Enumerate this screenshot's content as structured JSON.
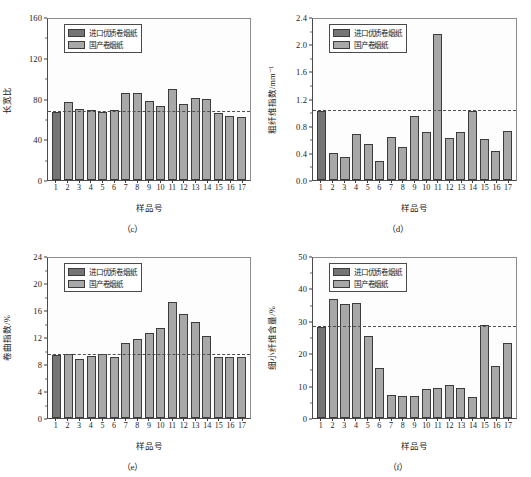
{
  "figure": {
    "panel_count": 4,
    "legend": {
      "imported_label": "进口优质卷烟纸",
      "domestic_label": "国产卷烟纸",
      "imported_color": "#757575",
      "domestic_color": "#a8a8a8"
    },
    "shared_xlabel": "样品号",
    "categories": [
      "1",
      "2",
      "3",
      "4",
      "5",
      "6",
      "7",
      "8",
      "9",
      "10",
      "11",
      "12",
      "13",
      "14",
      "15",
      "16",
      "17"
    ]
  },
  "chart_data": [
    {
      "type": "bar",
      "panel": "c",
      "caption": "（c）",
      "title": "",
      "xlabel": "样品号",
      "ylabel": "长宽比",
      "categories": [
        "1",
        "2",
        "3",
        "4",
        "5",
        "6",
        "7",
        "8",
        "9",
        "10",
        "11",
        "12",
        "13",
        "14",
        "15",
        "16",
        "17"
      ],
      "values": [
        68,
        78,
        71,
        70,
        68,
        70,
        86,
        86,
        79,
        74,
        90,
        76,
        82,
        81,
        67,
        64,
        63
      ],
      "first_is_imported": true,
      "ylim": [
        0,
        160
      ],
      "yticks": [
        0,
        40,
        80,
        120,
        160
      ],
      "ytick_labels": [
        "0",
        "40",
        "80",
        "120",
        "160"
      ],
      "minor_ticks": true,
      "reference_line": 68,
      "reference_line_style": "dashed",
      "grid": false,
      "legend_position": "top-left"
    },
    {
      "type": "bar",
      "panel": "d",
      "caption": "（d）",
      "title": "",
      "xlabel": "样品号",
      "ylabel": "粗纤维指数/mm⁻¹",
      "categories": [
        "1",
        "2",
        "3",
        "4",
        "5",
        "6",
        "7",
        "8",
        "9",
        "10",
        "11",
        "12",
        "13",
        "14",
        "15",
        "16",
        "17"
      ],
      "values": [
        1.03,
        0.41,
        0.35,
        0.68,
        0.53,
        0.28,
        0.64,
        0.49,
        0.96,
        0.71,
        2.17,
        0.62,
        0.71,
        1.03,
        0.61,
        0.43,
        0.73
      ],
      "first_is_imported": true,
      "ylim": [
        0.0,
        2.4
      ],
      "yticks": [
        0.0,
        0.4,
        0.8,
        1.2,
        1.6,
        2.0,
        2.4
      ],
      "ytick_labels": [
        "0.0",
        "0.4",
        "0.8",
        "1.2",
        "1.6",
        "2.0",
        "2.4"
      ],
      "minor_ticks": true,
      "reference_line": 1.03,
      "reference_line_style": "dashed",
      "grid": false,
      "legend_position": "top-left"
    },
    {
      "type": "bar",
      "panel": "e",
      "caption": "（e）",
      "title": "",
      "xlabel": "样品号",
      "ylabel": "卷曲指数/%",
      "categories": [
        "1",
        "2",
        "3",
        "4",
        "5",
        "6",
        "7",
        "8",
        "9",
        "10",
        "11",
        "12",
        "13",
        "14",
        "15",
        "16",
        "17"
      ],
      "values": [
        9.5,
        9.6,
        8.8,
        9.3,
        9.6,
        9.1,
        11.3,
        11.9,
        12.7,
        13.5,
        17.4,
        15.6,
        14.4,
        12.3,
        9.2,
        9.2,
        9.2
      ],
      "first_is_imported": true,
      "ylim": [
        0,
        24
      ],
      "yticks": [
        0,
        4,
        8,
        12,
        16,
        20,
        24
      ],
      "ytick_labels": [
        "0",
        "4",
        "8",
        "12",
        "16",
        "20",
        "24"
      ],
      "minor_ticks": true,
      "reference_line": 9.5,
      "reference_line_style": "dashed",
      "grid": false,
      "legend_position": "top-left"
    },
    {
      "type": "bar",
      "panel": "f",
      "caption": "（f）",
      "title": "",
      "xlabel": "样品号",
      "ylabel": "细小纤维含量/%",
      "categories": [
        "1",
        "2",
        "3",
        "4",
        "5",
        "6",
        "7",
        "8",
        "9",
        "10",
        "11",
        "12",
        "13",
        "14",
        "15",
        "16",
        "17"
      ],
      "values": [
        28.5,
        37.2,
        35.6,
        36.0,
        25.6,
        15.7,
        7.2,
        6.9,
        6.9,
        9.0,
        9.3,
        10.2,
        9.4,
        6.6,
        29.0,
        16.3,
        23.3
      ],
      "first_is_imported": true,
      "ylim": [
        0,
        50
      ],
      "yticks": [
        0,
        10,
        20,
        30,
        40,
        50
      ],
      "ytick_labels": [
        "0",
        "10",
        "20",
        "30",
        "40",
        "50"
      ],
      "minor_ticks": true,
      "reference_line": 28.5,
      "reference_line_style": "dashed",
      "grid": false,
      "legend_position": "top-left"
    }
  ]
}
